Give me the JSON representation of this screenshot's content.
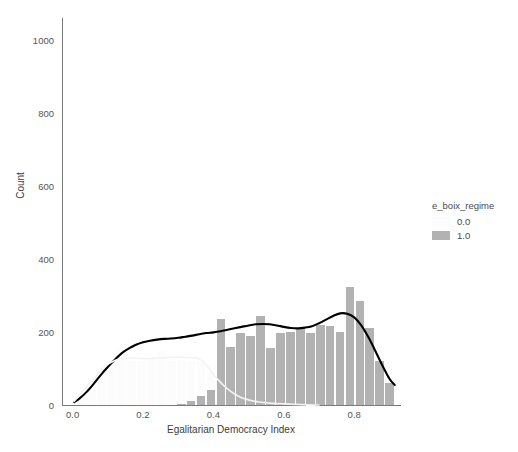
{
  "chart_data": {
    "type": "bar",
    "title": "",
    "subtitle": "",
    "xlabel": "Egalitarian Democracy Index",
    "ylabel": "Count",
    "xlim": [
      -0.03,
      0.93
    ],
    "ylim": [
      0,
      1060
    ],
    "xticks": [
      "0.0",
      "0.2",
      "0.4",
      "0.6",
      "0.8"
    ],
    "xtick_values": [
      0.0,
      0.2,
      0.4,
      0.6,
      0.8
    ],
    "yticks": [
      "0",
      "200",
      "400",
      "600",
      "800",
      "1000"
    ],
    "ytick_values": [
      0,
      200,
      400,
      600,
      800,
      1000
    ],
    "grid": false,
    "legend_position": "right",
    "legend_title": "e_boix_regime",
    "bin_width": 0.0282,
    "bin_starts": [
      0.0141,
      0.0423,
      0.0705,
      0.0987,
      0.1269,
      0.1551,
      0.1833,
      0.2115,
      0.2397,
      0.2679,
      0.2961,
      0.3243,
      0.3525,
      0.3807,
      0.4089,
      0.4371,
      0.4653,
      0.4935,
      0.5217,
      0.5499,
      0.5781,
      0.6063,
      0.6345,
      0.6627,
      0.6909,
      0.7191,
      0.7473,
      0.7755,
      0.8037,
      0.8319,
      0.8601,
      0.8883
    ],
    "series": [
      {
        "name": "0.0",
        "color": "#fcfcfc",
        "values": [
          20,
          55,
          95,
          115,
          150,
          120,
          120,
          128,
          148,
          120,
          122,
          120,
          118,
          90,
          55,
          36,
          26,
          18,
          12,
          8,
          5,
          3,
          2,
          1,
          0,
          0,
          0,
          0,
          0,
          0,
          0,
          0
        ]
      },
      {
        "name": "1.0",
        "color": "#b2b2b2",
        "values": [
          0,
          0,
          0,
          0,
          0,
          0,
          0,
          0,
          0,
          0,
          4,
          10,
          24,
          40,
          235,
          160,
          196,
          190,
          244,
          155,
          198,
          200,
          212,
          198,
          218,
          216,
          200,
          322,
          286,
          212,
          120,
          60
        ]
      }
    ],
    "kde_curves": [
      {
        "name": "kde-overlay",
        "color": "#000000",
        "points": [
          [
            0.005,
            8
          ],
          [
            0.02,
            18
          ],
          [
            0.04,
            36
          ],
          [
            0.06,
            58
          ],
          [
            0.08,
            82
          ],
          [
            0.1,
            104
          ],
          [
            0.12,
            124
          ],
          [
            0.14,
            142
          ],
          [
            0.16,
            155
          ],
          [
            0.18,
            165
          ],
          [
            0.2,
            172
          ],
          [
            0.22,
            176
          ],
          [
            0.24,
            179
          ],
          [
            0.26,
            181
          ],
          [
            0.28,
            182
          ],
          [
            0.3,
            184
          ],
          [
            0.32,
            187
          ],
          [
            0.34,
            190
          ],
          [
            0.36,
            194
          ],
          [
            0.38,
            197
          ],
          [
            0.4,
            199
          ],
          [
            0.42,
            202
          ],
          [
            0.44,
            206
          ],
          [
            0.46,
            210
          ],
          [
            0.48,
            214
          ],
          [
            0.5,
            218
          ],
          [
            0.52,
            221
          ],
          [
            0.54,
            222
          ],
          [
            0.56,
            221
          ],
          [
            0.58,
            218
          ],
          [
            0.6,
            214
          ],
          [
            0.62,
            211
          ],
          [
            0.64,
            210
          ],
          [
            0.66,
            212
          ],
          [
            0.68,
            216
          ],
          [
            0.7,
            224
          ],
          [
            0.72,
            234
          ],
          [
            0.74,
            244
          ],
          [
            0.76,
            251
          ],
          [
            0.78,
            250
          ],
          [
            0.8,
            240
          ],
          [
            0.82,
            218
          ],
          [
            0.84,
            186
          ],
          [
            0.86,
            148
          ],
          [
            0.88,
            108
          ],
          [
            0.9,
            72
          ],
          [
            0.915,
            55
          ]
        ]
      },
      {
        "name": "kde-overlay-faint",
        "color": "#f3f3f3",
        "points": [
          [
            0.005,
            10
          ],
          [
            0.03,
            40
          ],
          [
            0.06,
            72
          ],
          [
            0.09,
            104
          ],
          [
            0.12,
            122
          ],
          [
            0.15,
            128
          ],
          [
            0.18,
            128
          ],
          [
            0.21,
            127
          ],
          [
            0.24,
            128
          ],
          [
            0.27,
            130
          ],
          [
            0.3,
            131
          ],
          [
            0.33,
            130
          ],
          [
            0.355,
            128
          ],
          [
            0.37,
            120
          ],
          [
            0.385,
            104
          ],
          [
            0.4,
            84
          ],
          [
            0.42,
            62
          ],
          [
            0.44,
            44
          ],
          [
            0.46,
            30
          ],
          [
            0.48,
            20
          ],
          [
            0.5,
            14
          ],
          [
            0.53,
            8
          ],
          [
            0.56,
            5
          ],
          [
            0.6,
            3
          ],
          [
            0.65,
            1
          ],
          [
            0.7,
            0
          ]
        ]
      }
    ],
    "legend_entries": [
      {
        "label": "0.0",
        "color": "#fcfcfc"
      },
      {
        "label": "1.0",
        "color": "#b2b2b2"
      }
    ]
  }
}
